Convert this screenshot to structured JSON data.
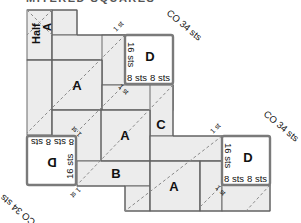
{
  "title": "MITERED SQUARES",
  "diagram": {
    "pieces": {
      "half_a": {
        "label_line1": "Half",
        "label_line2": "A"
      },
      "a_top": {
        "label": "A"
      },
      "a_middle": {
        "label": "A"
      },
      "a_bottom": {
        "label": "A"
      },
      "b": {
        "label": "B"
      },
      "c": {
        "label": "C"
      }
    },
    "d_boxes": [
      {
        "label": "D",
        "side": "16 sts",
        "bottom_left": "8 sts",
        "bottom_right": "8 sts",
        "cast_on": "CO 34 sts",
        "position": "top"
      },
      {
        "label": "D",
        "side": "16 sts",
        "bottom_left": "8 sts",
        "bottom_right": "8 sts",
        "cast_on": "CO 34 sts",
        "position": "right"
      },
      {
        "label": "D",
        "side": "16 sts",
        "bottom_left": "8 sts",
        "bottom_right": "8 sts",
        "cast_on": "CO 34 sts",
        "position": "left-rotated"
      }
    ],
    "stitch_markers": [
      "1 st",
      "1 st",
      "1 st",
      "1 st",
      "1 st",
      "1 st"
    ],
    "colors": {
      "piece_fill": "#ececec",
      "piece_stroke": "#6a6a6a",
      "d_box_stroke": "#7a7a7a",
      "fold_line": "#8a8a8a"
    }
  }
}
